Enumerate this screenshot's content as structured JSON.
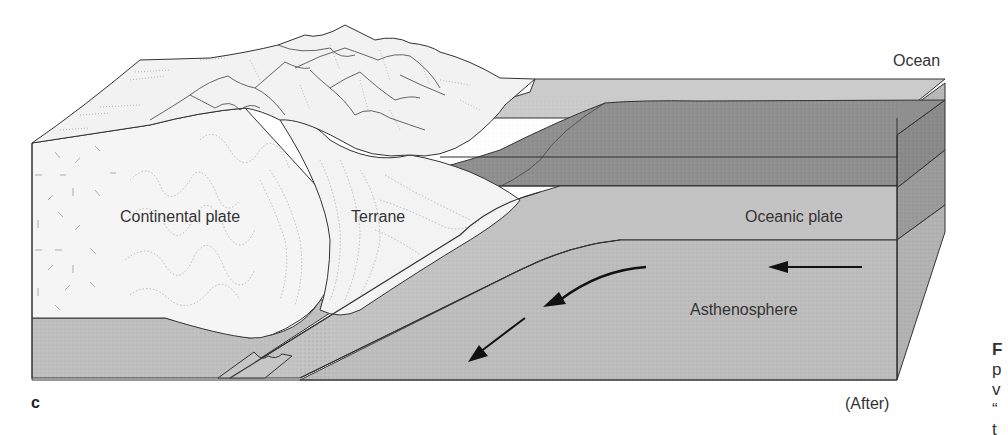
{
  "figure": {
    "panel_letter": "c",
    "stage_label": "(After)",
    "labels": {
      "ocean": "Ocean",
      "continental_plate": "Continental plate",
      "terrane": "Terrane",
      "oceanic_plate": "Oceanic plate",
      "asthenosphere": "Asthenosphere"
    },
    "cut_off_caption_fragments": [
      "F",
      "p",
      "v",
      "“",
      "t"
    ],
    "colors": {
      "background": "#ffffff",
      "continental_fill": "#f4f4f4",
      "mountain_fill": "#f1f1f1",
      "ocean_water": "#c9c9c9",
      "ocean_sediment": "#8e8e8e",
      "oceanic_plate": "#c2c2c2",
      "asthenosphere": "#bdbdbd",
      "side_face_dark": "#9e9e9e",
      "side_face_light": "#b0b0b0",
      "outline": "#333333"
    },
    "arrows": [
      {
        "name": "asthenosphere-flow-arrow-right",
        "direction": "left"
      },
      {
        "name": "asthenosphere-flow-arrow-curved",
        "direction": "down-left"
      },
      {
        "name": "subduction-arrow",
        "direction": "down-left"
      }
    ]
  }
}
